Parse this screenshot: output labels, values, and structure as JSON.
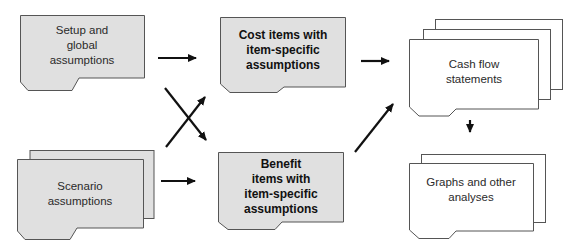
{
  "colors": {
    "shaded_fill": "#e0e0e0",
    "plain_fill": "#ffffff",
    "stroke": "#555555",
    "arrow": "#111111"
  },
  "nodes": {
    "setup": {
      "label": "Setup and\nglobal\nassumptions",
      "style": "shaded",
      "stacked": 1
    },
    "scenario": {
      "label": "Scenario\nassumptions",
      "style": "shaded",
      "stacked": 2
    },
    "cost": {
      "label": "Cost items with\nitem-specific\nassumptions",
      "style": "shaded-bold",
      "stacked": 1
    },
    "benefit": {
      "label": "Benefit\nitems with\nitem-specific\nassumptions",
      "style": "shaded-bold",
      "stacked": 1
    },
    "cashflow": {
      "label": "Cash flow\nstatements",
      "style": "plain",
      "stacked": 3
    },
    "graphs": {
      "label": "Graphs and other\nanalyses",
      "style": "plain",
      "stacked": 2
    }
  },
  "edges": [
    {
      "from": "setup",
      "to": "cost"
    },
    {
      "from": "setup",
      "to": "benefit"
    },
    {
      "from": "scenario",
      "to": "cost"
    },
    {
      "from": "scenario",
      "to": "benefit"
    },
    {
      "from": "cost",
      "to": "cashflow"
    },
    {
      "from": "benefit",
      "to": "cashflow"
    },
    {
      "from": "cashflow",
      "to": "graphs"
    }
  ]
}
